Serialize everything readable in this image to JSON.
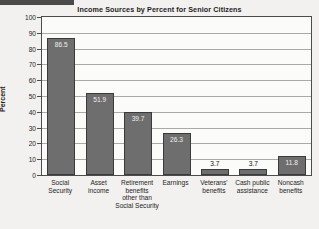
{
  "chart_data": {
    "type": "bar",
    "title": "Income Sources by Percent for Senior Citizens",
    "xlabel": "",
    "ylabel": "Percent",
    "ylim": [
      0,
      100
    ],
    "ytick_step": 10,
    "yticks": [
      "100",
      "90",
      "80",
      "70",
      "60",
      "50",
      "40",
      "30",
      "20",
      "10",
      "0"
    ],
    "grid": true,
    "legend": "none",
    "categories": [
      "Social\nSecurity",
      "Asset\nincome",
      "Retirement\nbenefits\nother than\nSocial Security",
      "Earnings",
      "Veterans'\nbenefits",
      "Cash public\nassistance",
      "Noncash\nbenefits"
    ],
    "values": [
      86.5,
      51.9,
      39.7,
      26.3,
      3.7,
      3.7,
      11.8
    ],
    "value_labels": [
      "86.5",
      "51.9",
      "39.7",
      "26.3",
      "3.7",
      "3.7",
      "11.8"
    ]
  },
  "style": {
    "bar_color": "#6e6e6e",
    "bar_edge_color": "#3a3a3a",
    "plot_background": "#fbfbfa",
    "page_background": "#f2f1ef",
    "gridline_color": "#a9a9a7",
    "axis_color": "#4c4c4c",
    "text_color": "#1d1d1d"
  }
}
